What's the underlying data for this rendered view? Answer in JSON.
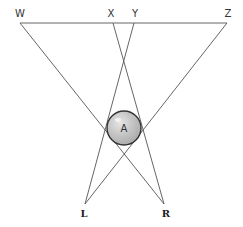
{
  "diagram": {
    "points": {
      "W": {
        "label": "W",
        "x": 20,
        "y": 23
      },
      "X": {
        "label": "X",
        "x": 113,
        "y": 23
      },
      "Y": {
        "label": "Y",
        "x": 134,
        "y": 23
      },
      "Z": {
        "label": "Z",
        "x": 227,
        "y": 23
      },
      "L": {
        "label": "L",
        "x": 85,
        "y": 204
      },
      "R": {
        "label": "R",
        "x": 164,
        "y": 204
      }
    },
    "circle": {
      "label": "A",
      "cx": 124,
      "cy": 128,
      "r": 17,
      "fill": "#c4c4c4",
      "stroke": "#333333"
    },
    "line_color": "#555555",
    "segments": [
      [
        "W",
        "Z"
      ],
      [
        "W",
        "R"
      ],
      [
        "Z",
        "L"
      ],
      [
        "X",
        "R"
      ],
      [
        "Y",
        "L"
      ]
    ]
  }
}
